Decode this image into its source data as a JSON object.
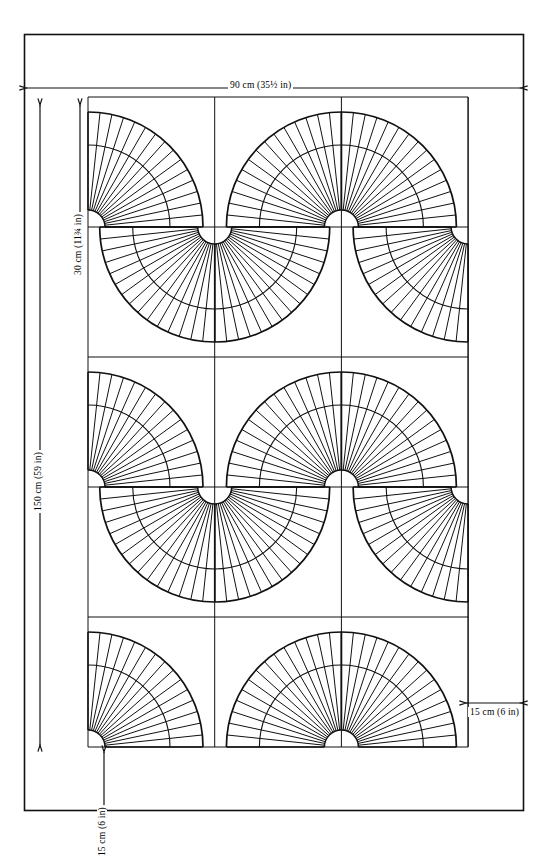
{
  "diagram": {
    "type": "technical-sewing-pattern",
    "stroke_color": "#111111",
    "background_color": "#ffffff"
  },
  "dimensions": {
    "width_label": "90 cm (35½ in)",
    "height_label": "150 cm (59 in)",
    "block_label": "30 cm (11¾ in)",
    "margin_bottom_label": "15 cm (6 in)",
    "margin_right_label": "15 cm (6 in)"
  },
  "geometry": {
    "outer_border": {
      "x": 24,
      "y": 34,
      "width": 499,
      "height": 776
    },
    "grid": {
      "x": 88,
      "y": 97,
      "cols": 3,
      "rows": 5,
      "cell_w": 126.7,
      "cell_h": 130
    },
    "fan": {
      "inner_radius": 17,
      "outer_radius": 115,
      "wedges": 15,
      "band_radius": 82
    },
    "fan_cells": [
      {
        "col": 0,
        "row": 0,
        "corner": "bl"
      },
      {
        "col": 1,
        "row": 0,
        "corner": "br"
      },
      {
        "col": 2,
        "row": 0,
        "corner": "bl"
      },
      {
        "col": 0,
        "row": 1,
        "corner": "tr"
      },
      {
        "col": 1,
        "row": 1,
        "corner": "tl"
      },
      {
        "col": 2,
        "row": 1,
        "corner": "tr"
      },
      {
        "col": 0,
        "row": 2,
        "corner": "bl"
      },
      {
        "col": 1,
        "row": 2,
        "corner": "br"
      },
      {
        "col": 2,
        "row": 2,
        "corner": "bl"
      },
      {
        "col": 0,
        "row": 3,
        "corner": "tr"
      },
      {
        "col": 1,
        "row": 3,
        "corner": "tl"
      },
      {
        "col": 2,
        "row": 3,
        "corner": "tr"
      },
      {
        "col": 0,
        "row": 4,
        "corner": "bl"
      },
      {
        "col": 1,
        "row": 4,
        "corner": "br"
      },
      {
        "col": 2,
        "row": 4,
        "corner": "bl"
      }
    ]
  }
}
